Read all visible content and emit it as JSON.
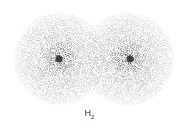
{
  "diagram": {
    "label": "H",
    "label_subscript": "2",
    "atoms": [
      {
        "name": "hydrogen-atom-left",
        "cx": 60,
        "cy": 59,
        "r": 46
      },
      {
        "name": "hydrogen-atom-right",
        "cx": 128,
        "cy": 59,
        "r": 46
      }
    ],
    "colors": {
      "background": "#ffffff",
      "cloud": "#9a9a9a",
      "nucleus": "#2a2a2a",
      "text": "#333333"
    }
  }
}
